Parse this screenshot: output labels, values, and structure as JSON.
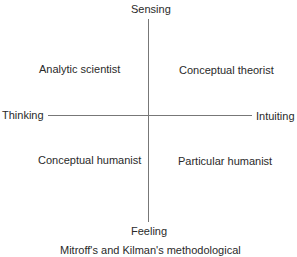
{
  "axes": {
    "top": "Sensing",
    "bottom": "Feeling",
    "left": "Thinking",
    "right": "Intuiting"
  },
  "quadrants": {
    "top_left": "Analytic scientist",
    "top_right": "Conceptual theorist",
    "bottom_left": "Conceptual humanist",
    "bottom_right": "Particular humanist"
  },
  "caption": "Mitroff's and Kilman's methodological"
}
